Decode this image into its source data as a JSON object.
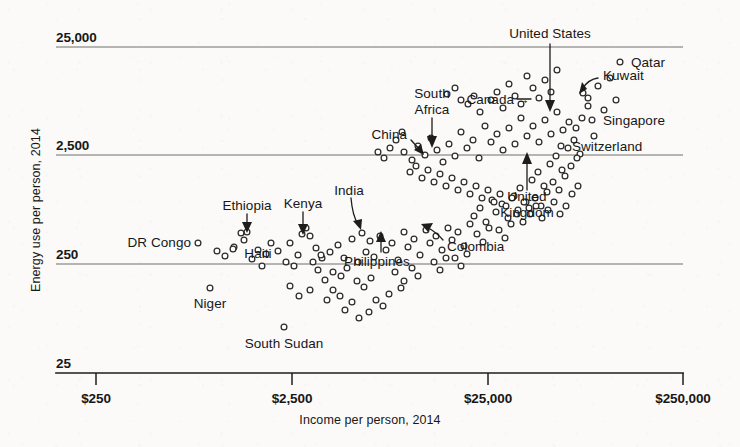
{
  "chart_data": {
    "type": "scatter",
    "title": "",
    "xlabel": "Income per person, 2014",
    "ylabel": "Energy use per person, 2014",
    "xscale": "log",
    "yscale": "log",
    "xlim": [
      250,
      250000
    ],
    "ylim": [
      25,
      25000
    ],
    "grid": "horizontal gridlines at each y tick",
    "legend": "none",
    "xticks": [
      "$250",
      "$2,500",
      "$25,000",
      "$250,000"
    ],
    "xtick_values": [
      250,
      2500,
      25000,
      250000
    ],
    "yticks": [
      "25",
      "250",
      "2,500",
      "25,000"
    ],
    "ytick_values": [
      25,
      250,
      2500,
      25000
    ],
    "annotations": [
      {
        "label": "United States",
        "style": "down-arrow"
      },
      {
        "label": "Qatar",
        "style": "dot-left"
      },
      {
        "label": "Kuwait",
        "style": "curved-arrow"
      },
      {
        "label": "Singapore",
        "style": "dot-left"
      },
      {
        "label": "Switzerland",
        "style": "dot-left"
      },
      {
        "label": "Canada",
        "style": "right-arrow"
      },
      {
        "label": "South Africa",
        "style": "down-arrow"
      },
      {
        "label": "China",
        "style": "curved-arrow"
      },
      {
        "label": "United Kingdom",
        "style": "up-arrow"
      },
      {
        "label": "India",
        "style": "curved-arrow"
      },
      {
        "label": "Kenya",
        "style": "down-arrow"
      },
      {
        "label": "Ethiopia",
        "style": "down-arrow"
      },
      {
        "label": "Haiti",
        "style": "plain"
      },
      {
        "label": "Philippines",
        "style": "up-arrow"
      },
      {
        "label": "Colombia",
        "style": "curved-arrow"
      },
      {
        "label": "DR Congo",
        "style": "dot-right"
      },
      {
        "label": "Niger",
        "style": "plain"
      },
      {
        "label": "South Sudan",
        "style": "plain"
      }
    ],
    "labeled_points": [
      {
        "name": "Qatar",
        "income": 124000,
        "energy": 18000
      },
      {
        "name": "Kuwait",
        "income": 74000,
        "energy": 9300
      },
      {
        "name": "Singapore",
        "income": 80000,
        "energy": 5300
      },
      {
        "name": "Switzerland",
        "income": 56000,
        "energy": 3100
      },
      {
        "name": "United States",
        "income": 52000,
        "energy": 6900
      },
      {
        "name": "Canada",
        "income": 42000,
        "energy": 7700
      },
      {
        "name": "United Kingdom",
        "income": 38000,
        "energy": 2900
      },
      {
        "name": "South Africa",
        "income": 12500,
        "energy": 2700
      },
      {
        "name": "China",
        "income": 12000,
        "energy": 2200
      },
      {
        "name": "Colombia",
        "income": 12500,
        "energy": 690
      },
      {
        "name": "India",
        "income": 5400,
        "energy": 640
      },
      {
        "name": "Philippines",
        "income": 6500,
        "energy": 470
      },
      {
        "name": "Kenya",
        "income": 2800,
        "energy": 500
      },
      {
        "name": "Ethiopia",
        "income": 1400,
        "energy": 480
      },
      {
        "name": "Haiti",
        "income": 1700,
        "energy": 390
      },
      {
        "name": "DR Congo",
        "income": 700,
        "energy": 390
      },
      {
        "name": "Niger",
        "income": 900,
        "energy": 150
      },
      {
        "name": "South Sudan",
        "income": 2100,
        "energy": 73
      }
    ],
    "points": [
      [
        198,
        243
      ],
      [
        210,
        288
      ],
      [
        284,
        327
      ],
      [
        241,
        233
      ],
      [
        247,
        232
      ],
      [
        244,
        240
      ],
      [
        234,
        247
      ],
      [
        258,
        250
      ],
      [
        271,
        243
      ],
      [
        290,
        243
      ],
      [
        302,
        234
      ],
      [
        298,
        255
      ],
      [
        306,
        228
      ],
      [
        310,
        236
      ],
      [
        316,
        248
      ],
      [
        322,
        258
      ],
      [
        330,
        252
      ],
      [
        294,
        266
      ],
      [
        286,
        262
      ],
      [
        262,
        266
      ],
      [
        338,
        245
      ],
      [
        344,
        258
      ],
      [
        352,
        239
      ],
      [
        347,
        268
      ],
      [
        358,
        262
      ],
      [
        333,
        272
      ],
      [
        341,
        276
      ],
      [
        325,
        280
      ],
      [
        318,
        270
      ],
      [
        362,
        233
      ],
      [
        370,
        241
      ],
      [
        366,
        252
      ],
      [
        374,
        257
      ],
      [
        380,
        236
      ],
      [
        386,
        250
      ],
      [
        392,
        243
      ],
      [
        398,
        260
      ],
      [
        404,
        232
      ],
      [
        357,
        281
      ],
      [
        364,
        287
      ],
      [
        371,
        278
      ],
      [
        333,
        290
      ],
      [
        340,
        296
      ],
      [
        327,
        300
      ],
      [
        310,
        290
      ],
      [
        299,
        296
      ],
      [
        290,
        286
      ],
      [
        408,
        247
      ],
      [
        414,
        239
      ],
      [
        420,
        255
      ],
      [
        426,
        230
      ],
      [
        412,
        268
      ],
      [
        418,
        276
      ],
      [
        404,
        281
      ],
      [
        430,
        243
      ],
      [
        436,
        236
      ],
      [
        442,
        250
      ],
      [
        448,
        228
      ],
      [
        434,
        262
      ],
      [
        440,
        270
      ],
      [
        446,
        258
      ],
      [
        452,
        240
      ],
      [
        458,
        232
      ],
      [
        464,
        246
      ],
      [
        470,
        224
      ],
      [
        455,
        258
      ],
      [
        461,
        266
      ],
      [
        467,
        254
      ],
      [
        395,
        272
      ],
      [
        401,
        288
      ],
      [
        389,
        294
      ],
      [
        376,
        300
      ],
      [
        383,
        306
      ],
      [
        369,
        312
      ],
      [
        352,
        302
      ],
      [
        345,
        310
      ],
      [
        359,
        318
      ],
      [
        474,
        216
      ],
      [
        480,
        208
      ],
      [
        486,
        222
      ],
      [
        492,
        200
      ],
      [
        477,
        234
      ],
      [
        483,
        242
      ],
      [
        489,
        228
      ],
      [
        496,
        212
      ],
      [
        502,
        204
      ],
      [
        508,
        218
      ],
      [
        499,
        230
      ],
      [
        505,
        238
      ],
      [
        511,
        224
      ],
      [
        514,
        196
      ],
      [
        520,
        188
      ],
      [
        526,
        202
      ],
      [
        517,
        214
      ],
      [
        523,
        222
      ],
      [
        529,
        208
      ],
      [
        532,
        180
      ],
      [
        538,
        172
      ],
      [
        544,
        186
      ],
      [
        535,
        198
      ],
      [
        541,
        206
      ],
      [
        547,
        192
      ],
      [
        550,
        164
      ],
      [
        556,
        156
      ],
      [
        562,
        170
      ],
      [
        553,
        182
      ],
      [
        559,
        190
      ],
      [
        565,
        176
      ],
      [
        568,
        148
      ],
      [
        574,
        140
      ],
      [
        580,
        154
      ],
      [
        571,
        166
      ],
      [
        577,
        158
      ],
      [
        404,
        152
      ],
      [
        412,
        160
      ],
      [
        418,
        146
      ],
      [
        425,
        155
      ],
      [
        431,
        138
      ],
      [
        437,
        150
      ],
      [
        443,
        162
      ],
      [
        449,
        144
      ],
      [
        455,
        156
      ],
      [
        461,
        132
      ],
      [
        467,
        148
      ],
      [
        473,
        140
      ],
      [
        479,
        158
      ],
      [
        485,
        126
      ],
      [
        491,
        142
      ],
      [
        497,
        134
      ],
      [
        503,
        150
      ],
      [
        509,
        128
      ],
      [
        515,
        144
      ],
      [
        521,
        118
      ],
      [
        527,
        136
      ],
      [
        533,
        126
      ],
      [
        539,
        142
      ],
      [
        545,
        120
      ],
      [
        551,
        134
      ],
      [
        557,
        112
      ],
      [
        563,
        130
      ],
      [
        569,
        122
      ],
      [
        491,
        100
      ],
      [
        497,
        92
      ],
      [
        503,
        108
      ],
      [
        509,
        84
      ],
      [
        515,
        96
      ],
      [
        521,
        104
      ],
      [
        527,
        76
      ],
      [
        533,
        88
      ],
      [
        539,
        98
      ],
      [
        545,
        80
      ],
      [
        551,
        92
      ],
      [
        557,
        70
      ],
      [
        468,
        104
      ],
      [
        474,
        96
      ],
      [
        480,
        112
      ],
      [
        455,
        88
      ],
      [
        461,
        100
      ],
      [
        447,
        94
      ],
      [
        583,
        93
      ],
      [
        588,
        98
      ],
      [
        592,
        120
      ],
      [
        561,
        146
      ],
      [
        620,
        62
      ],
      [
        598,
        86
      ],
      [
        604,
        110
      ],
      [
        576,
        128
      ],
      [
        610,
        78
      ],
      [
        616,
        100
      ],
      [
        594,
        136
      ],
      [
        582,
        118
      ],
      [
        588,
        106
      ],
      [
        217,
        251
      ],
      [
        225,
        256
      ],
      [
        233,
        249
      ],
      [
        252,
        259
      ],
      [
        266,
        254
      ],
      [
        278,
        251
      ],
      [
        313,
        262
      ],
      [
        321,
        255
      ],
      [
        396,
        140
      ],
      [
        402,
        132
      ],
      [
        390,
        148
      ],
      [
        384,
        158
      ],
      [
        378,
        152
      ],
      [
        410,
        172
      ],
      [
        416,
        166
      ],
      [
        422,
        178
      ],
      [
        428,
        170
      ],
      [
        434,
        182
      ],
      [
        440,
        174
      ],
      [
        446,
        186
      ],
      [
        452,
        178
      ],
      [
        458,
        190
      ],
      [
        464,
        182
      ],
      [
        470,
        194
      ],
      [
        476,
        186
      ],
      [
        482,
        198
      ],
      [
        488,
        190
      ],
      [
        494,
        202
      ],
      [
        500,
        194
      ],
      [
        506,
        206
      ],
      [
        512,
        198
      ],
      [
        518,
        210
      ],
      [
        524,
        202
      ],
      [
        530,
        214
      ],
      [
        536,
        206
      ],
      [
        542,
        218
      ],
      [
        548,
        210
      ],
      [
        554,
        202
      ],
      [
        560,
        214
      ],
      [
        566,
        206
      ],
      [
        572,
        194
      ],
      [
        578,
        186
      ]
    ]
  },
  "labels": {
    "y_25000": "25,000",
    "y_2500": "2,500",
    "y_250": "250",
    "y_25": "25",
    "x_250": "$250",
    "x_2500": "$2,500",
    "x_25000": "$25,000",
    "x_250000": "$250,000",
    "y_axis_title": "Energy use per person, 2014",
    "x_axis_title": "Income per person, 2014",
    "united_states": "United States",
    "qatar": "Qatar",
    "kuwait": "Kuwait",
    "singapore": "Singapore",
    "switzerland": "Switzerland",
    "canada": "Canada",
    "south_africa_line1": "South",
    "south_africa_line2": "Africa",
    "china": "China",
    "united_kingdom_line1": "United",
    "united_kingdom_line2": "Kingdom",
    "india": "India",
    "kenya": "Kenya",
    "ethiopia": "Ethiopia",
    "haiti": "Haiti",
    "philippines": "Philippines",
    "colombia": "Colombia",
    "dr_congo": "DR Congo",
    "niger": "Niger",
    "south_sudan": "South Sudan",
    "canada_arrow": "→"
  },
  "colors": {
    "background": "#fbfaf8",
    "text": "#171717",
    "gridline": "#6f6f6f",
    "axis": "#1d1d1d",
    "dot_fill": "#ffffff",
    "dot_stroke": "#2b2b2b"
  }
}
